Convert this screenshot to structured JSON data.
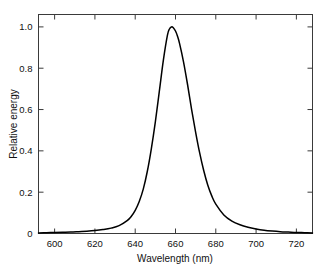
{
  "chart_data": {
    "type": "line",
    "title": "",
    "xlabel": "Wavelength  (nm)",
    "ylabel": "Relative energy",
    "xlim": [
      592,
      728
    ],
    "ylim": [
      0,
      1.06
    ],
    "xticks": [
      600,
      620,
      640,
      660,
      680,
      700,
      720
    ],
    "xtick_labels": [
      "600",
      "620",
      "640",
      "660",
      "680",
      "700",
      "720"
    ],
    "yticks": [
      0,
      0.2,
      0.4,
      0.6,
      0.8,
      1.0
    ],
    "ytick_labels": [
      "0",
      "0.2",
      "0.4",
      "0.6",
      "0.8",
      "1.0"
    ],
    "grid": false,
    "legend": null,
    "series": [
      {
        "name": "Relative energy",
        "color": "#000000",
        "peak_x": 658,
        "peak_y": 1.0,
        "fwhm": 19,
        "x": [
          592,
          596,
          600,
          604,
          608,
          612,
          616,
          620,
          624,
          628,
          632,
          636,
          638,
          640,
          642,
          644,
          646,
          648,
          650,
          652,
          654,
          656,
          657,
          658,
          659,
          660,
          661,
          662,
          664,
          666,
          668,
          670,
          672,
          674,
          676,
          678,
          680,
          684,
          688,
          692,
          696,
          700,
          704,
          708,
          712,
          716,
          720,
          724,
          728
        ],
        "y": [
          0.003,
          0.004,
          0.005,
          0.006,
          0.007,
          0.009,
          0.011,
          0.014,
          0.019,
          0.026,
          0.038,
          0.062,
          0.082,
          0.112,
          0.155,
          0.215,
          0.3,
          0.41,
          0.54,
          0.69,
          0.84,
          0.96,
          0.99,
          1.0,
          0.995,
          0.98,
          0.955,
          0.92,
          0.83,
          0.72,
          0.6,
          0.49,
          0.39,
          0.305,
          0.235,
          0.182,
          0.142,
          0.09,
          0.06,
          0.042,
          0.03,
          0.022,
          0.016,
          0.012,
          0.009,
          0.007,
          0.005,
          0.004,
          0.003
        ]
      }
    ]
  },
  "axes": {
    "x_title": "Wavelength  (nm)",
    "y_title": "Relative energy"
  }
}
